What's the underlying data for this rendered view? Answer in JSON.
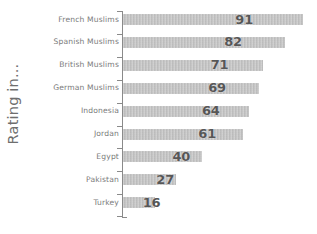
{
  "chart_data": {
    "type": "bar",
    "orientation": "horizontal",
    "title": "",
    "subtitle": "",
    "xlabel": "",
    "ylabel": "Rating in...",
    "grid": false,
    "legend": null,
    "xlim": [
      0,
      100
    ],
    "categories": [
      "French Muslims",
      "Spanish Muslims",
      "British Muslims",
      "German Muslims",
      "Indonesia",
      "Jordan",
      "Egypt",
      "Pakistan",
      "Turkey"
    ],
    "values": [
      91,
      82,
      71,
      69,
      64,
      61,
      40,
      27,
      16
    ],
    "data_labels": [
      "91",
      "82",
      "71",
      "69",
      "64",
      "61",
      "40",
      "27",
      "16"
    ],
    "tick_labels": [],
    "bar_color": "#bcbcbc",
    "label_color": "#575757",
    "category_label_color": "#7b7b7b",
    "axis_color": "#8a8a8a"
  },
  "axis": {
    "y_title": "Rating in..."
  }
}
